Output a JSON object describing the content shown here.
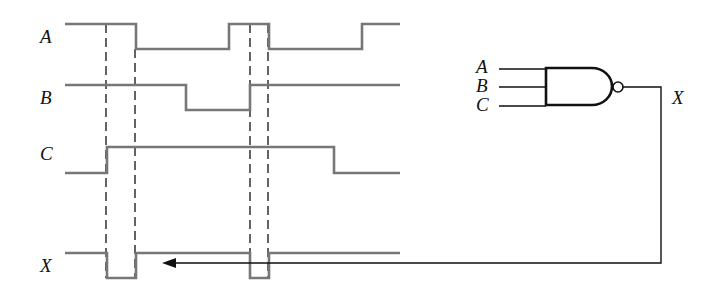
{
  "timing_diagram": {
    "signals": [
      {
        "name": "A",
        "label_xy": [
          48,
          106
        ],
        "points": [
          [
            65,
            24
          ],
          [
            136,
            24
          ],
          [
            136,
            49
          ],
          [
            229,
            49
          ],
          [
            229,
            24
          ],
          [
            269,
            24
          ],
          [
            269,
            49
          ],
          [
            362,
            49
          ],
          [
            362,
            24
          ],
          [
            400,
            24
          ]
        ]
      },
      {
        "name": "B",
        "label_xy": [
          48,
          105
        ],
        "points": [
          [
            65,
            85
          ],
          [
            186,
            85
          ],
          [
            186,
            110
          ],
          [
            250,
            110
          ],
          [
            250,
            85
          ],
          [
            400,
            85
          ]
        ]
      },
      {
        "name": "C",
        "label_xy": [
          48,
          160
        ],
        "points": [
          [
            65,
            173
          ],
          [
            107,
            173
          ],
          [
            107,
            147
          ],
          [
            334,
            147
          ],
          [
            334,
            173
          ],
          [
            400,
            173
          ]
        ]
      },
      {
        "name": "X",
        "label_xy": [
          48,
          273
        ],
        "points": [
          [
            65,
            253
          ],
          [
            107,
            253
          ],
          [
            107,
            278
          ],
          [
            136,
            278
          ],
          [
            136,
            253
          ],
          [
            250,
            253
          ],
          [
            250,
            278
          ],
          [
            269,
            278
          ],
          [
            269,
            253
          ],
          [
            400,
            253
          ]
        ]
      }
    ],
    "labels": {
      "A": "A",
      "B": "B",
      "C": "C",
      "X": "X"
    },
    "dashed_markers_x": [
      106,
      135,
      250,
      268
    ],
    "dashed_y_range": [
      24,
      278
    ]
  },
  "gate_diagram": {
    "type": "NAND",
    "inputs": [
      "A",
      "B",
      "C"
    ],
    "output": "X",
    "labels": {
      "A": "A",
      "B": "B",
      "C": "C",
      "X": "X"
    }
  }
}
